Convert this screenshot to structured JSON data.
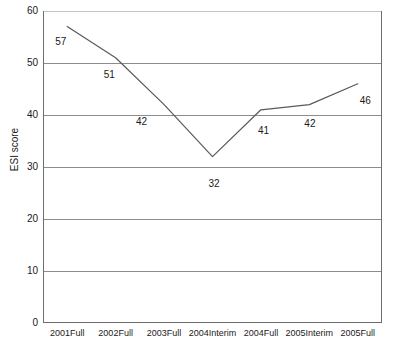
{
  "chart_data": {
    "type": "line",
    "title": "",
    "xlabel": "",
    "ylabel": "ESI score",
    "categories": [
      "2001Full",
      "2002Full",
      "2003Full",
      "2004Interim",
      "2004Full",
      "2005Interim",
      "2005Full"
    ],
    "values": [
      57,
      51,
      42,
      32,
      41,
      42,
      46
    ],
    "series": [
      {
        "name": "ESI score",
        "values": [
          57,
          51,
          42,
          32,
          41,
          42,
          46
        ]
      }
    ],
    "ylim": [
      0,
      60
    ],
    "ytick_labels": [
      "0",
      "10",
      "20",
      "30",
      "40",
      "50",
      "60"
    ],
    "ytick_values": [
      0,
      10,
      20,
      30,
      40,
      50,
      60
    ],
    "grid": "horizontal",
    "legend": "none",
    "data_labels": [
      "57",
      "51",
      "42",
      "32",
      "41",
      "42",
      "46"
    ],
    "colors": {
      "line": "#595959",
      "gridline": "#8c8c8c",
      "axis": "#6e6e6e",
      "text": "#1a1a1a",
      "background": "#ffffff"
    }
  }
}
